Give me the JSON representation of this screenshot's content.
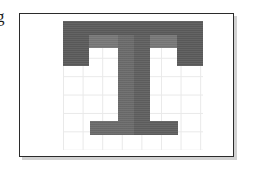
{
  "document": {
    "type": "glyph-raster-figure",
    "description": "Uppercase letter T rendered over a light square grid inside a thin bordered frame"
  },
  "edge_text": {
    "fragment": "g"
  },
  "panel": {
    "border_color": "#2b2b2b",
    "background_color": "#ffffff",
    "shadow": "3px 3px rgba(0,0,0,0.18)"
  },
  "grid": {
    "line_color": "#e9e9e9",
    "cell_width_px": 19.6,
    "cell_height_px": 18.4,
    "columns": 7,
    "rows": 7,
    "visible": true
  },
  "glyph": {
    "character": "T",
    "font_style": "serif-slab",
    "colors": {
      "edge_dark": "#5b5b5b",
      "body": "#6b6b6b",
      "body_light": "#787878",
      "stem_right": "#5f5f5f"
    },
    "segments": [
      {
        "name": "top-bar-left-serif",
        "x": 0,
        "y": 0,
        "w": 26,
        "h": 45,
        "color": "#5b5b5b"
      },
      {
        "name": "top-bar-right-serif",
        "x": 114,
        "y": 0,
        "w": 26,
        "h": 45,
        "color": "#5b5b5b"
      },
      {
        "name": "top-bar",
        "x": 0,
        "y": 0,
        "w": 140,
        "h": 14,
        "color": "#5b5b5b"
      },
      {
        "name": "top-bar-inner",
        "x": 26,
        "y": 14,
        "w": 88,
        "h": 13,
        "color": "#787878"
      },
      {
        "name": "stem-left",
        "x": 55,
        "y": 14,
        "w": 16,
        "h": 100,
        "color": "#6b6b6b"
      },
      {
        "name": "stem-right",
        "x": 71,
        "y": 14,
        "w": 16,
        "h": 100,
        "color": "#5f5f5f"
      },
      {
        "name": "foot-left",
        "x": 27,
        "y": 100,
        "w": 28,
        "h": 14,
        "color": "#6b6b6b"
      },
      {
        "name": "foot-right",
        "x": 87,
        "y": 100,
        "w": 28,
        "h": 14,
        "color": "#5f5f5f"
      }
    ]
  }
}
